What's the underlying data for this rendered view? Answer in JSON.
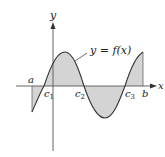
{
  "diagram": {
    "function_label": "y = f(x)",
    "axis_labels": {
      "x": "x",
      "y": "y"
    },
    "points": {
      "a": "a",
      "b": "b",
      "c1": "c",
      "c1_sub": "1",
      "c2": "c",
      "c2_sub": "2",
      "c3": "c",
      "c3_sub": "3"
    },
    "colors": {
      "fill": "#d4d4d4",
      "curve": "#333333",
      "axis": "#555555"
    }
  }
}
